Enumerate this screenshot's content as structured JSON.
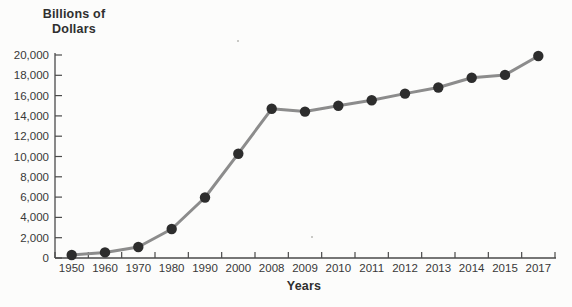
{
  "page": {
    "background": "#fcfcfb"
  },
  "chart_data": {
    "type": "line",
    "title": "Billions of Dollars",
    "title_lines": [
      "Billions of",
      "Dollars"
    ],
    "xlabel": "Years",
    "ylabel": "Billions of Dollars",
    "categories": [
      "1950",
      "1960",
      "1970",
      "1980",
      "1990",
      "2000",
      "2008",
      "2009",
      "2010",
      "2011",
      "2012",
      "2013",
      "2014",
      "2015",
      "2017"
    ],
    "series": [
      {
        "name": "Billions of Dollars",
        "values": [
          300,
          550,
          1080,
          2860,
          5960,
          10280,
          14700,
          14420,
          15000,
          15540,
          16200,
          16800,
          17760,
          18040,
          19900
        ]
      }
    ],
    "ylim": [
      0,
      20000
    ],
    "ytick_step": 2000,
    "ytick_labels": [
      "0",
      "2,000",
      "4,000",
      "6,000",
      "8,000",
      "10,000",
      "12,000",
      "14,000",
      "16,000",
      "18,000",
      "20,000"
    ],
    "grid": false,
    "legend": "none",
    "colors": {
      "line": "#8c8c8c",
      "marker": "#2d2d2d",
      "axis": "#4a4a4a",
      "tick_text": "#383838"
    }
  }
}
